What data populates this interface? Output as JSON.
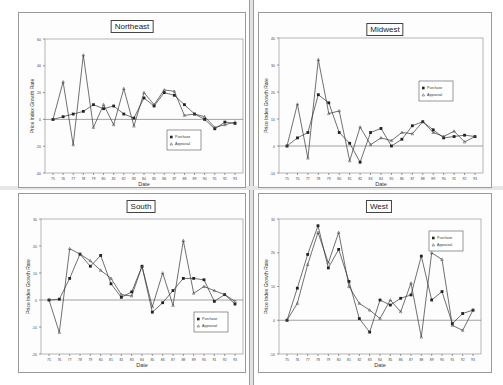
{
  "chart_data": [
    {
      "type": "line",
      "title": "Northeast",
      "xlabel": "Date",
      "ylabel": "Price Index Growth Rate",
      "ylim": [
        -40,
        60
      ],
      "yticks": [
        60,
        40,
        20,
        0,
        -20,
        -40
      ],
      "categories": [
        "75",
        "76",
        "77",
        "78",
        "79",
        "80",
        "81",
        "82",
        "83",
        "84",
        "85",
        "86",
        "87",
        "88",
        "89",
        "90",
        "91",
        "92",
        "93"
      ],
      "series": [
        {
          "name": "Purchase",
          "marker": "square",
          "values": [
            0,
            2,
            4,
            6,
            11,
            8,
            10,
            4,
            1,
            16,
            10,
            20,
            18,
            11,
            4,
            0,
            -7,
            -2,
            -3
          ]
        },
        {
          "name": "Appraisal",
          "marker": "triangle",
          "values": [
            0,
            28,
            -19,
            48,
            -6,
            11,
            -4,
            23,
            -5,
            20,
            11,
            22,
            21,
            3,
            4,
            2,
            -6,
            -4,
            -2
          ]
        }
      ],
      "legend_position": "lower right",
      "grid": false
    },
    {
      "type": "line",
      "title": "Midwest",
      "xlabel": "Date",
      "ylabel": "Price Index Growth Rate",
      "ylim": [
        -10,
        40
      ],
      "yticks": [
        40,
        30,
        20,
        10,
        0,
        -10
      ],
      "categories": [
        "75",
        "76",
        "77",
        "78",
        "79",
        "80",
        "81",
        "82",
        "83",
        "84",
        "85",
        "86",
        "87",
        "88",
        "89",
        "90",
        "91",
        "92",
        "93"
      ],
      "series": [
        {
          "name": "Purchase",
          "marker": "square",
          "values": [
            0,
            3,
            5,
            19,
            16,
            5,
            1,
            -6,
            5,
            6.5,
            0,
            2.5,
            7.5,
            9,
            6,
            3,
            3.5,
            4,
            3.5
          ]
        },
        {
          "name": "Appraisal",
          "marker": "triangle",
          "values": [
            0,
            15.5,
            -4.5,
            32,
            12,
            13,
            -5.5,
            7,
            0.5,
            3,
            2,
            5,
            4.5,
            9,
            5,
            3.5,
            5.5,
            1.5,
            3.5
          ]
        }
      ],
      "legend_position": "upper right",
      "grid": false
    },
    {
      "type": "line",
      "title": "South",
      "xlabel": "Date",
      "ylabel": "Price Index Growth Rate",
      "ylim": [
        -20,
        30
      ],
      "yticks": [
        30,
        20,
        10,
        0,
        -10,
        -20
      ],
      "categories": [
        "75",
        "76",
        "77",
        "78",
        "79",
        "80",
        "81",
        "82",
        "83",
        "84",
        "85",
        "86",
        "87",
        "88",
        "89",
        "90",
        "91",
        "92",
        "93"
      ],
      "series": [
        {
          "name": "Purchase",
          "marker": "square",
          "values": [
            0,
            0.3,
            8,
            17,
            12.5,
            16.5,
            6,
            1,
            3,
            12.5,
            -4.5,
            -1,
            3.5,
            8,
            8,
            7.5,
            -0.5,
            2,
            -1.5
          ]
        },
        {
          "name": "Appraisal",
          "marker": "triangle",
          "values": [
            0,
            -12,
            19,
            17,
            14.5,
            11,
            8,
            2,
            1.5,
            12.5,
            -2.5,
            10,
            -2,
            22,
            2.5,
            5,
            3.5,
            2,
            -0.5
          ]
        }
      ],
      "legend_position": "lower right",
      "grid": false
    },
    {
      "type": "line",
      "title": "West",
      "xlabel": "Date",
      "ylabel": "Price Index Growth Rate",
      "ylim": [
        -10,
        30
      ],
      "yticks": [
        30,
        20,
        10,
        0,
        -10
      ],
      "categories": [
        "75",
        "76",
        "77",
        "78",
        "79",
        "80",
        "81",
        "82",
        "83",
        "84",
        "85",
        "86",
        "87",
        "88",
        "89",
        "90",
        "91",
        "92",
        "93"
      ],
      "series": [
        {
          "name": "Purchase",
          "marker": "square",
          "values": [
            0,
            9.5,
            19.5,
            28,
            15.5,
            21,
            11.5,
            0.5,
            -3.5,
            6,
            4.5,
            6.5,
            7.5,
            19,
            6,
            8.5,
            -1,
            2,
            3
          ]
        },
        {
          "name": "Appraisal",
          "marker": "triangle",
          "values": [
            0,
            5,
            16.5,
            26,
            17,
            26,
            10,
            5,
            3,
            0.5,
            6,
            2.5,
            11,
            -5,
            20,
            18,
            -1.5,
            -3,
            3
          ]
        }
      ],
      "legend_position": "upper right",
      "grid": false
    }
  ],
  "panels": [
    {
      "title": "Northeast",
      "xlabel": "Date",
      "ylabel": "Price Index Growth Rate",
      "legend": [
        "Purchase",
        "Appraisal"
      ]
    },
    {
      "title": "Midwest",
      "xlabel": "Date",
      "ylabel": "Price Index Growth Rate",
      "legend": [
        "Purchase",
        "Appraisal"
      ]
    },
    {
      "title": "South",
      "xlabel": "Date",
      "ylabel": "Price Index Growth Rate",
      "legend": [
        "Purchase",
        "Appraisal"
      ]
    },
    {
      "title": "West",
      "xlabel": "Date",
      "ylabel": "Price Index Growth Rate",
      "legend": [
        "Purchase",
        "Appraisal"
      ]
    }
  ],
  "colors": {
    "line": "#333333",
    "axis": "#555555",
    "panel_border": "#9a9a9a"
  }
}
